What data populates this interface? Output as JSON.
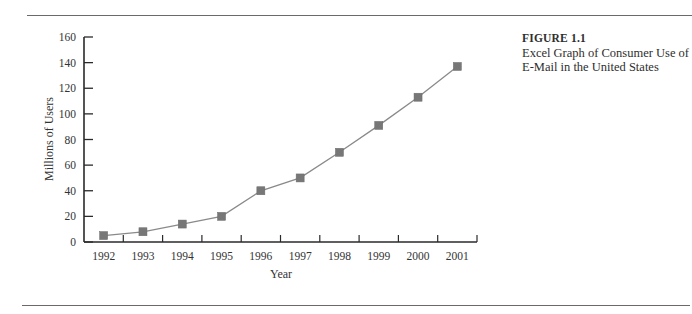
{
  "figure": {
    "number": "FIGURE 1.1",
    "caption_line1": "Excel Graph of Consumer Use of",
    "caption_line2": "E-Mail in the United States"
  },
  "colors": {
    "rule": "#6a6a6a",
    "axis": "#2a2a2a",
    "line": "#8a8a8a",
    "marker": "#777777"
  },
  "chart_data": {
    "type": "line",
    "title": "Excel Graph of Consumer Use of E-Mail in the United States",
    "xlabel": "Year",
    "ylabel": "Millions of Users",
    "categories": [
      "1992",
      "1993",
      "1994",
      "1995",
      "1996",
      "1997",
      "1998",
      "1999",
      "2000",
      "2001"
    ],
    "series": [
      {
        "name": "Millions of Users",
        "marker": "square",
        "values": [
          5,
          8,
          14,
          20,
          40,
          50,
          70,
          91,
          113,
          137
        ]
      }
    ],
    "ylim": [
      0,
      160
    ],
    "yticks": [
      0,
      20,
      40,
      60,
      80,
      100,
      120,
      140,
      160
    ],
    "grid": false,
    "legend": "none"
  }
}
